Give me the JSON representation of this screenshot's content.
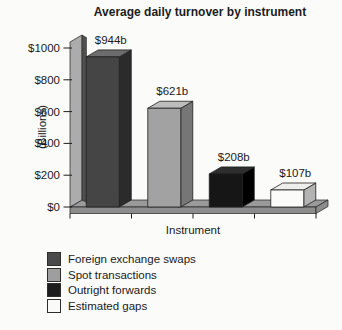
{
  "chart_data": {
    "type": "bar",
    "projection": "3d",
    "title": "Average daily turnover by instrument",
    "xlabel": "Instrument",
    "ylabel": "(Billions)",
    "ylim": [
      0,
      1000
    ],
    "ytick_interval": 200,
    "ytick_labels": [
      "$0",
      "$200",
      "$400",
      "$600",
      "$800",
      "$1000"
    ],
    "categories": [
      "Foreign exchange swaps",
      "Spot transactions",
      "Outright forwards",
      "Estimated gaps"
    ],
    "values": [
      944,
      621,
      208,
      107
    ],
    "value_labels": [
      "$944b",
      "$621b",
      "$208b",
      "$107b"
    ],
    "grid": false,
    "legend": {
      "position": "bottom-left",
      "entries": [
        {
          "label": "Foreign exchange swaps",
          "color": "#4a4a4a"
        },
        {
          "label": "Spot transactions",
          "color": "#9e9e9e"
        },
        {
          "label": "Outright forwards",
          "color": "#1c1c1c"
        },
        {
          "label": "Estimated gaps",
          "color": "#fafaf8"
        }
      ]
    },
    "colors": {
      "bar_faces": [
        {
          "front": "#454545",
          "top": "#6c6c6c",
          "side": "#2b2b2b"
        },
        {
          "front": "#a2a2a2",
          "top": "#bdbdbd",
          "side": "#767676"
        },
        {
          "front": "#161616",
          "top": "#2e2e2e",
          "side": "#000000"
        },
        {
          "front": "#fbfbf9",
          "top": "#eeeeec",
          "side": "#b3b3b3"
        }
      ],
      "floor_top": "#9a9a9a",
      "floor_front": "#8d8d8d",
      "wall_face": "#acacac",
      "wall_edge": "#4f4f4f",
      "outline": "#1f1f1f",
      "text": "#1a1a1a",
      "background": "#fbfbfa"
    }
  }
}
